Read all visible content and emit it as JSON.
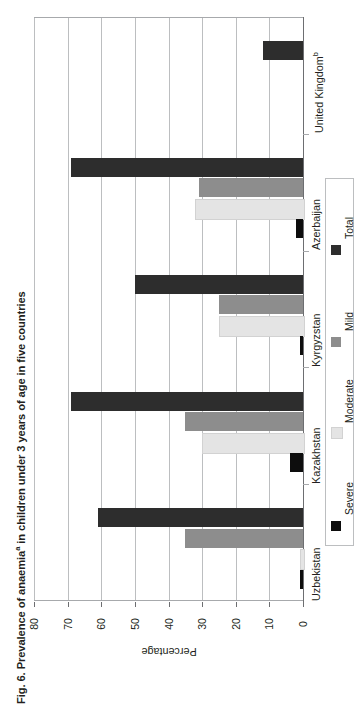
{
  "figure": {
    "title_prefix": "Fig. 6. Prevalence of anaemia",
    "title_superscript": "a",
    "title_suffix": " in children under 3 years of age in five countries"
  },
  "axis": {
    "value_axis_title": "Percentage",
    "tick_labels": [
      "80",
      "70",
      "60",
      "50",
      "40",
      "30",
      "20",
      "10",
      "0"
    ]
  },
  "legend": {
    "items": [
      {
        "label": "Severe",
        "color": "#0d0d0d"
      },
      {
        "label": "Moderate",
        "color": "#e4e4e4"
      },
      {
        "label": "Mild",
        "color": "#8d8d8d"
      },
      {
        "label": "Total",
        "color": "#2d2d2d"
      }
    ]
  },
  "categories_display": [
    {
      "name": "United Kingdom",
      "superscript": "b"
    },
    {
      "name": "Azerbaijan",
      "superscript": ""
    },
    {
      "name": "Kyrgyzstan",
      "superscript": ""
    },
    {
      "name": "Kazakhstan",
      "superscript": ""
    },
    {
      "name": "Uzbekistan",
      "superscript": ""
    }
  ],
  "chart_data": {
    "type": "bar",
    "orientation": "horizontal",
    "xlabel": "Percentage",
    "ylabel": "",
    "xlim": [
      0,
      80
    ],
    "xticks": [
      0,
      10,
      20,
      30,
      40,
      50,
      60,
      70,
      80
    ],
    "grid": "vertical",
    "legend_position": "right",
    "categories": [
      "Uzbekistan",
      "Kazakhstan",
      "Kyrgyzstan",
      "Azerbaijan",
      "United Kingdom"
    ],
    "series": [
      {
        "name": "Severe",
        "color": "#0d0d0d",
        "values": [
          1,
          4,
          1,
          2,
          0
        ]
      },
      {
        "name": "Moderate",
        "color": "#e4e4e4",
        "values": [
          1,
          30,
          25,
          32,
          0
        ]
      },
      {
        "name": "Mild",
        "color": "#8d8d8d",
        "values": [
          35,
          35,
          25,
          31,
          0
        ]
      },
      {
        "name": "Total",
        "color": "#2d2d2d",
        "values": [
          61,
          69,
          50,
          69,
          12
        ]
      }
    ]
  }
}
